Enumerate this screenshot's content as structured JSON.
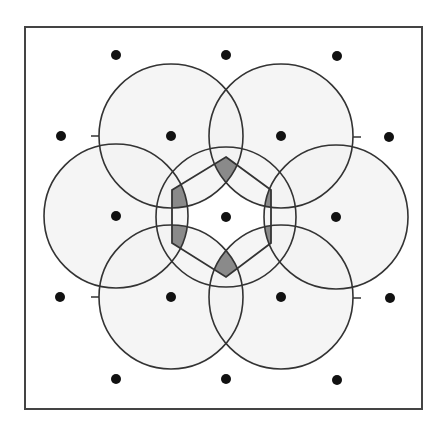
{
  "figure": {
    "background": "#ffffff",
    "frame": {
      "x": 25,
      "y": 27,
      "width": 397,
      "height": 382,
      "stroke": "#444444"
    },
    "circle_fill": "#f2f2f2",
    "circle_stroke": "#333333",
    "dot_color": "#111111",
    "shade_color": "#8a8a8a",
    "dots": [
      {
        "x": 116,
        "y": 55
      },
      {
        "x": 226,
        "y": 55
      },
      {
        "x": 337,
        "y": 56
      },
      {
        "x": 61,
        "y": 136
      },
      {
        "x": 171,
        "y": 136
      },
      {
        "x": 281,
        "y": 136
      },
      {
        "x": 389,
        "y": 137
      },
      {
        "x": 116,
        "y": 216
      },
      {
        "x": 226,
        "y": 217
      },
      {
        "x": 336,
        "y": 217
      },
      {
        "x": 60,
        "y": 297
      },
      {
        "x": 171,
        "y": 297
      },
      {
        "x": 281,
        "y": 297
      },
      {
        "x": 390,
        "y": 298
      },
      {
        "x": 116,
        "y": 379
      },
      {
        "x": 226,
        "y": 379
      },
      {
        "x": 337,
        "y": 380
      }
    ],
    "outer_circles": [
      {
        "cx": 171,
        "cy": 136,
        "r": 72
      },
      {
        "cx": 281,
        "cy": 136,
        "r": 72
      },
      {
        "cx": 116,
        "cy": 216,
        "r": 72
      },
      {
        "cx": 336,
        "cy": 217,
        "r": 72
      },
      {
        "cx": 171,
        "cy": 297,
        "r": 72
      },
      {
        "cx": 281,
        "cy": 297,
        "r": 72
      }
    ],
    "center_circle": {
      "cx": 226,
      "cy": 217,
      "r": 70
    },
    "hexagon": [
      [
        226,
        157
      ],
      [
        271,
        190
      ],
      [
        271,
        243
      ],
      [
        226,
        277
      ],
      [
        172,
        243
      ],
      [
        172,
        190
      ]
    ],
    "ticks": [
      {
        "x1": 91,
        "y1": 136,
        "x2": 99,
        "y2": 136
      },
      {
        "x1": 353,
        "y1": 137,
        "x2": 361,
        "y2": 137
      },
      {
        "x1": 91,
        "y1": 297,
        "x2": 99,
        "y2": 297
      },
      {
        "x1": 353,
        "y1": 298,
        "x2": 361,
        "y2": 298
      }
    ]
  }
}
